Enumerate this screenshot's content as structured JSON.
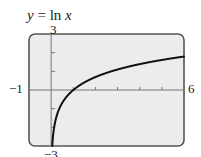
{
  "title": {
    "lhs": "y",
    "eq": " = ln ",
    "rhs": "x"
  },
  "labels": {
    "ymax": "3",
    "ymin": "−3",
    "xmin": "−1",
    "xmax": "6"
  },
  "colors": {
    "screen_fill": "#ececec",
    "screen_border": "#555555",
    "axis": "#777777",
    "curve": "#111111"
  },
  "chart_data": {
    "type": "line",
    "title": "y = ln x",
    "xlabel": "",
    "ylabel": "",
    "xlim": [
      -1,
      6
    ],
    "ylim": [
      -3,
      3
    ],
    "x_ticks": [
      1,
      2,
      3,
      4,
      5,
      6
    ],
    "y_ticks": [
      -2,
      -1,
      1,
      2,
      3
    ],
    "grid": false,
    "legend": "none",
    "series": [
      {
        "name": "ln x",
        "x": [
          0.05,
          0.1,
          0.2,
          0.3,
          0.5,
          0.75,
          1,
          1.5,
          2,
          2.5,
          3,
          3.5,
          4,
          4.5,
          5,
          5.5,
          6
        ],
        "values": [
          -3.0,
          -2.3,
          -1.61,
          -1.2,
          -0.69,
          -0.29,
          0,
          0.41,
          0.69,
          0.92,
          1.1,
          1.25,
          1.39,
          1.5,
          1.61,
          1.7,
          1.79
        ]
      }
    ]
  }
}
